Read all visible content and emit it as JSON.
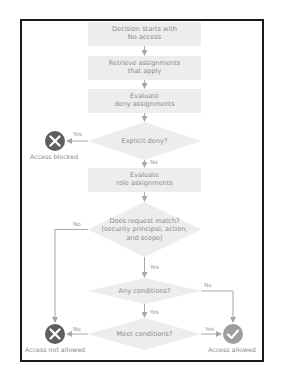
{
  "diagram": {
    "colors": {
      "frame": "#1a1a1a",
      "box_fill": "#ededed",
      "text": "#8a8a8a",
      "connector": "#a8a8a8",
      "deny_icon": "#5e5e5e",
      "allow_icon": "#9e9e9e"
    },
    "steps": [
      {
        "line1": "Decision starts with",
        "line2": "No access"
      },
      {
        "line1": "Retrieve assignments",
        "line2": "that apply"
      },
      {
        "line1": "Evaluate",
        "line2": "deny assignments"
      },
      {
        "line1": "Evaluate",
        "line2": "role assignments"
      }
    ],
    "decisions": [
      {
        "line1": "Explicit deny?"
      },
      {
        "line1": "Does request match?",
        "line2": "(security principal, action,",
        "line3": "and scope)"
      },
      {
        "line1": "Any conditions?"
      },
      {
        "line1": "Meet conditions?"
      }
    ],
    "edge_labels": {
      "explicit_deny_yes": "Yes",
      "explicit_deny_no": "No",
      "match_no": "No",
      "match_yes": "Yes",
      "any_conditions_no": "No",
      "any_conditions_yes": "Yes",
      "meet_conditions_no": "No",
      "meet_conditions_yes": "Yes"
    },
    "outcomes": {
      "blocked": {
        "icon": "x-circle-icon",
        "label": "Access blocked"
      },
      "not_allowed": {
        "icon": "x-circle-icon",
        "label": "Access not allowed"
      },
      "allowed": {
        "icon": "check-circle-icon",
        "label": "Access allowed"
      }
    }
  }
}
